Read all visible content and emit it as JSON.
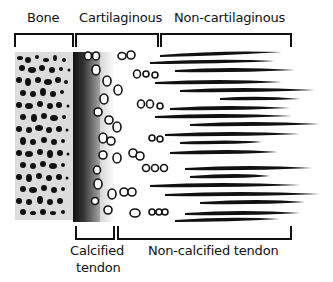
{
  "top_labels": {
    "bone": "Bone",
    "cartilaginous": "Cartilaginous",
    "non_cartilaginous": "Non-cartilaginous"
  },
  "bottom_labels": {
    "calcified_line1": "Calcified",
    "calcified_line2": "tendon",
    "non_calcified": "Non-calcified tendon"
  },
  "regions": [
    {
      "name": "bone",
      "x0": 15,
      "x1": 73
    },
    {
      "name": "cartilaginous",
      "x0": 76,
      "x1": 158
    },
    {
      "name": "non-cartilaginous",
      "x0": 161,
      "x1": 291
    },
    {
      "name": "calcified-tendon",
      "x0": 76,
      "x1": 114
    },
    {
      "name": "non-calcified-tendon",
      "x0": 118,
      "x1": 291
    }
  ],
  "colors": {
    "ink": "#111111",
    "bone_bg": "#dcdcdc",
    "background": "#ffffff"
  }
}
